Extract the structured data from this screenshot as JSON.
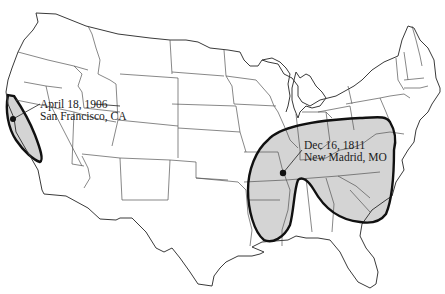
{
  "map": {
    "title": "",
    "style": {
      "outline_color": "#3a3a3a",
      "region_stroke": "#111111",
      "region_fill": "#d4d4d4",
      "background": "#ffffff"
    },
    "events": [
      {
        "date": "April 18, 1906",
        "location": "San Francisco, CA",
        "epicenter": [
          13,
          119
        ]
      },
      {
        "date": "Dec 16, 1811",
        "location": "New Madrid, MO",
        "epicenter": [
          283,
          173
        ]
      }
    ]
  }
}
